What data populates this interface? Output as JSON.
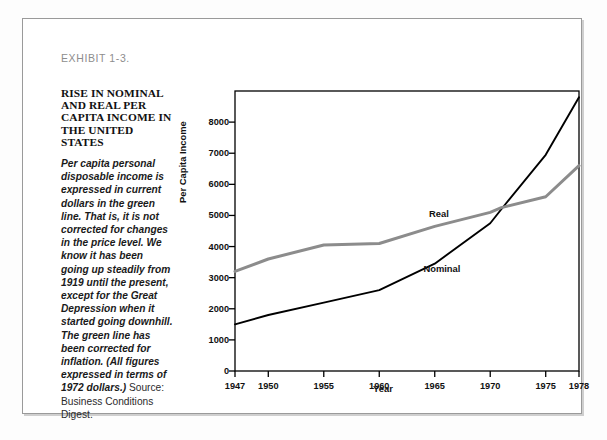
{
  "exhibit": {
    "label": "EXHIBIT 1-3."
  },
  "sidebar": {
    "headline": "RISE IN NOMINAL AND REAL PER CAPITA INCOME IN THE UNITED STATES",
    "body_italic": "Per capita personal disposable income is expressed in current dollars in the green line. That is, it is not corrected for changes in the price level. We know it has been going up steadily from 1919 until the present, except for the Great Depression when it started going downhill. The green line has been corrected for inflation. (All figures expressed in terms of 1972 dollars.)",
    "body_roman": " Source: Business Conditions Digest."
  },
  "colors": {
    "nominal": "#000000",
    "real": "#8c8c8c",
    "frame": "#9a9a9a",
    "axis": "#000000",
    "exhibit_text": "#8d8d8d"
  },
  "chart_data": {
    "type": "line",
    "title": "",
    "xlabel": "Year",
    "ylabel": "Per Capita Income",
    "xlim": [
      1947,
      1978
    ],
    "ylim": [
      0,
      9000
    ],
    "grid": false,
    "legend_position": "inline-annotation",
    "xticks": [
      1947,
      1950,
      1955,
      1960,
      1965,
      1970,
      1975,
      1978
    ],
    "xticklabels": [
      "1947",
      "1950",
      "1955",
      "1960",
      "1965",
      "1970",
      "1975",
      "1978"
    ],
    "yticks": [
      0,
      1000,
      2000,
      3000,
      4000,
      5000,
      6000,
      7000,
      8000
    ],
    "yticklabels": [
      "0",
      "1000",
      "2000",
      "3000",
      "4000",
      "5000",
      "6000",
      "7000",
      "8000"
    ],
    "x": [
      1947,
      1950,
      1955,
      1960,
      1965,
      1970,
      1971,
      1975,
      1978
    ],
    "series": [
      {
        "name": "Nominal",
        "color": "#000000",
        "values": [
          1500,
          1800,
          2200,
          2600,
          3450,
          4750,
          5200,
          6950,
          8800
        ],
        "label_x": 1965.6,
        "label_y": 3250
      },
      {
        "name": "Real",
        "color": "#8c8c8c",
        "values": [
          3200,
          3600,
          4050,
          4100,
          4650,
          5100,
          5250,
          5600,
          6600
        ],
        "label_x": 1966.1,
        "label_y": 5000
      }
    ],
    "annotations": [
      {
        "text": "Real",
        "series": "Real"
      },
      {
        "text": "Nominal",
        "series": "Nominal"
      }
    ]
  }
}
